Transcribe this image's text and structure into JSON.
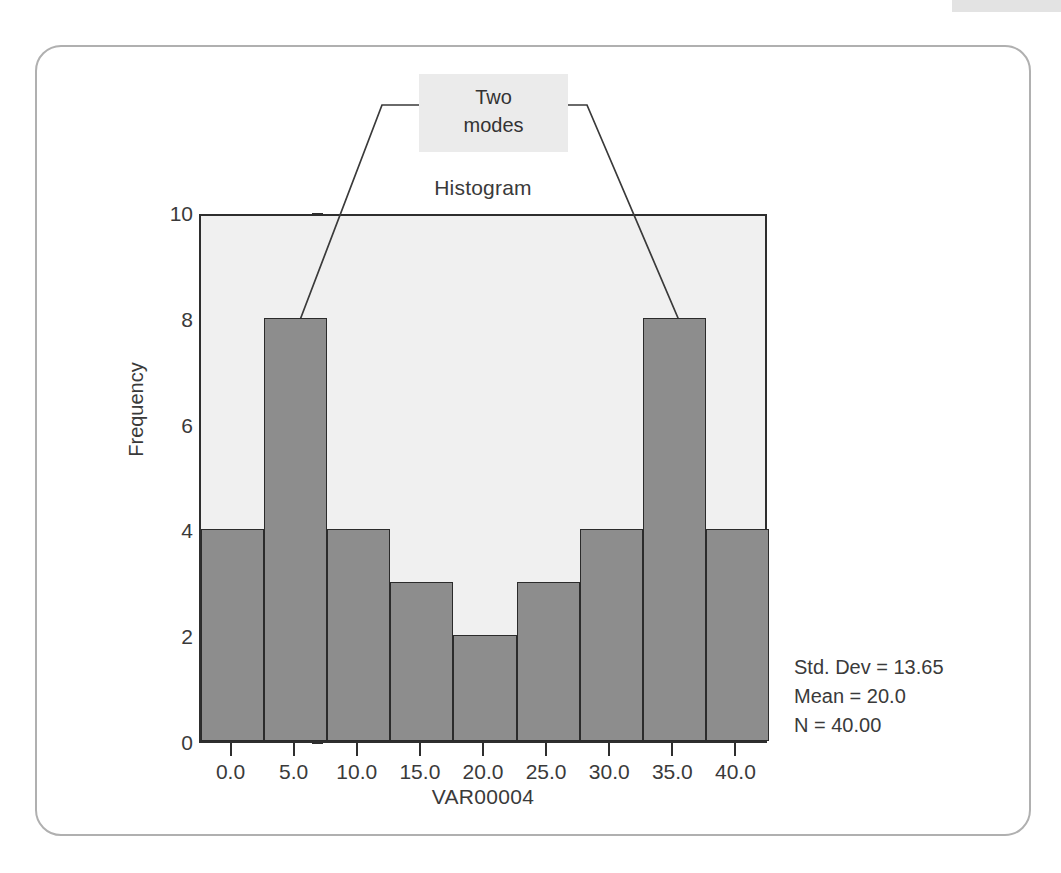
{
  "figure": {
    "frame_color": "#b0b0b0",
    "background": "#ffffff"
  },
  "chart_data": {
    "type": "bar",
    "title": "Histogram",
    "xlabel": "VAR00004",
    "ylabel": "Frequency",
    "categories": [
      "0.0",
      "5.0",
      "10.0",
      "15.0",
      "20.0",
      "25.0",
      "30.0",
      "35.0",
      "40.0"
    ],
    "values": [
      4,
      8,
      4,
      3,
      2,
      3,
      4,
      8,
      4
    ],
    "x_tick_labels": [
      "0.0",
      "5.0",
      "10.0",
      "15.0",
      "20.0",
      "25.0",
      "30.0",
      "35.0",
      "40.0"
    ],
    "y_tick_labels": [
      "0",
      "2",
      "4",
      "6",
      "8",
      "10"
    ],
    "y_tick_values": [
      0,
      2,
      4,
      6,
      8,
      10
    ],
    "ylim": [
      0,
      10
    ],
    "xlim": [
      -2.5,
      42.5
    ],
    "bin_width": 5,
    "grid": false,
    "legend": null,
    "bar_fill": "#8d8d8d",
    "bar_edge": "#2b2b2b",
    "plot_background": "#f0f0f0",
    "annotations": [
      {
        "text_lines": [
          "Two",
          "modes"
        ],
        "points_to": [
          5.0,
          35.0
        ],
        "box_background": "#ebebeb"
      }
    ],
    "statistics": [
      "Std. Dev = 13.65",
      "Mean = 20.0",
      "N = 40.00"
    ]
  },
  "annotation": {
    "line1": "Two",
    "line2": "modes"
  },
  "stats": {
    "std_dev": "Std. Dev = 13.65",
    "mean": "Mean = 20.0",
    "n": "N = 40.00"
  }
}
